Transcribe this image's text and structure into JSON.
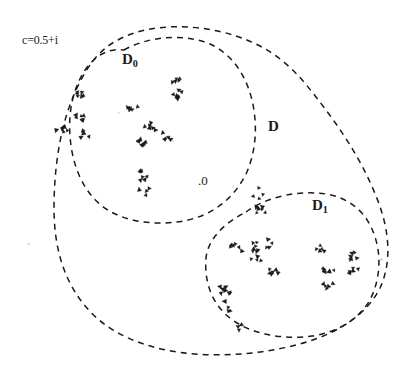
{
  "figure": {
    "background_color": "#ffffff",
    "ink_color": "#1a1a1a",
    "width": 402,
    "height": 378
  },
  "labels": {
    "parameter": "c=0.5+i",
    "subregion_0_main": "D",
    "subregion_0_sub": "0",
    "outer_region": "D",
    "subregion_1_main": "D",
    "subregion_1_sub": "1",
    "origin_marker": ".0"
  },
  "chart_data": {
    "type": "scatter",
    "title": "",
    "xlabel": "",
    "ylabel": "",
    "xlim": [
      0,
      402
    ],
    "ylim": [
      0,
      378
    ],
    "grid": false,
    "legend": "none",
    "annotations": [
      {
        "text": "c=0.5+i",
        "x": 22,
        "y": 40
      },
      {
        "text": "D0",
        "x": 122,
        "y": 60
      },
      {
        "text": "D",
        "x": 268,
        "y": 127
      },
      {
        "text": "D1",
        "x": 312,
        "y": 206
      },
      {
        "text": ".0",
        "x": 198,
        "y": 181
      }
    ],
    "boundaries": [
      {
        "name": "D-outer",
        "style": "dashed",
        "path": "M 118 40 C 150 22, 200 24, 236 36 C 270 47, 292 66, 312 92 C 336 122, 360 156, 376 196 C 390 230, 392 262, 380 288 C 366 316, 336 334, 300 344 C 256 356, 206 358, 166 350 C 128 342, 100 326, 82 302 C 62 276, 54 244, 54 208 C 54 162, 62 116, 80 82 C 90 62, 102 48, 118 40 Z"
      },
      {
        "name": "D0-inner",
        "style": "dashed",
        "path": "M 124 50 C 152 34, 192 34, 214 46 C 234 57, 246 76, 252 100 C 258 126, 256 152, 246 174 C 234 198, 214 214, 188 220 C 158 227, 122 222, 102 206 C 82 190, 72 164, 70 136 C 68 110, 74 84, 88 66 C 98 54, 110 48, 124 50 Z"
      },
      {
        "name": "D1-inner",
        "style": "dashed",
        "path": "M 246 212 C 268 196, 300 190, 326 194 C 350 198, 366 212, 374 234 C 382 256, 380 280, 370 300 C 358 320, 338 332, 312 336 C 282 340, 250 334, 230 318 C 212 304, 204 282, 206 258 C 208 238, 226 222, 246 212 Z"
      }
    ],
    "clusters": [
      {
        "id": "c0-1",
        "region": "D0",
        "center": [
          62,
          128
        ],
        "n": 7
      },
      {
        "id": "c0-2",
        "region": "D0",
        "center": [
          82,
          96
        ],
        "n": 6
      },
      {
        "id": "c0-3",
        "region": "D0",
        "center": [
          78,
          116
        ],
        "n": 6
      },
      {
        "id": "c0-4",
        "region": "D0",
        "center": [
          84,
          135
        ],
        "n": 5
      },
      {
        "id": "c0-5",
        "region": "D0",
        "center": [
          133,
          110
        ],
        "n": 6
      },
      {
        "id": "c0-6",
        "region": "D0",
        "center": [
          150,
          127
        ],
        "n": 6
      },
      {
        "id": "c0-7",
        "region": "D0",
        "center": [
          140,
          142
        ],
        "n": 7
      },
      {
        "id": "c0-8",
        "region": "D0",
        "center": [
          168,
          136
        ],
        "n": 5
      },
      {
        "id": "c0-9",
        "region": "D0",
        "center": [
          178,
          79
        ],
        "n": 5
      },
      {
        "id": "c0-10",
        "region": "D0",
        "center": [
          177,
          95
        ],
        "n": 7
      },
      {
        "id": "c0-11",
        "region": "D0",
        "center": [
          143,
          175
        ],
        "n": 7
      },
      {
        "id": "c0-12",
        "region": "D0",
        "center": [
          145,
          190
        ],
        "n": 4
      },
      {
        "id": "c1-1",
        "region": "D1",
        "center": [
          258,
          193
        ],
        "n": 4
      },
      {
        "id": "c1-2",
        "region": "D1",
        "center": [
          259,
          211
        ],
        "n": 6
      },
      {
        "id": "c1-3",
        "region": "D1",
        "center": [
          236,
          249
        ],
        "n": 6
      },
      {
        "id": "c1-4",
        "region": "D1",
        "center": [
          257,
          247
        ],
        "n": 7
      },
      {
        "id": "c1-5",
        "region": "D1",
        "center": [
          256,
          261
        ],
        "n": 4
      },
      {
        "id": "c1-6",
        "region": "D1",
        "center": [
          270,
          243
        ],
        "n": 4
      },
      {
        "id": "c1-7",
        "region": "D1",
        "center": [
          272,
          273
        ],
        "n": 6
      },
      {
        "id": "c1-8",
        "region": "D1",
        "center": [
          224,
          290
        ],
        "n": 7
      },
      {
        "id": "c1-9",
        "region": "D1",
        "center": [
          226,
          307
        ],
        "n": 4
      },
      {
        "id": "c1-10",
        "region": "D1",
        "center": [
          322,
          249
        ],
        "n": 5
      },
      {
        "id": "c1-11",
        "region": "D1",
        "center": [
          328,
          268
        ],
        "n": 7
      },
      {
        "id": "c1-12",
        "region": "D1",
        "center": [
          327,
          285
        ],
        "n": 5
      },
      {
        "id": "c1-13",
        "region": "D1",
        "center": [
          352,
          256
        ],
        "n": 6
      },
      {
        "id": "c1-14",
        "region": "D1",
        "center": [
          353,
          270
        ],
        "n": 5
      },
      {
        "id": "c1-15",
        "region": "D1",
        "center": [
          240,
          330
        ],
        "n": 3
      }
    ]
  }
}
